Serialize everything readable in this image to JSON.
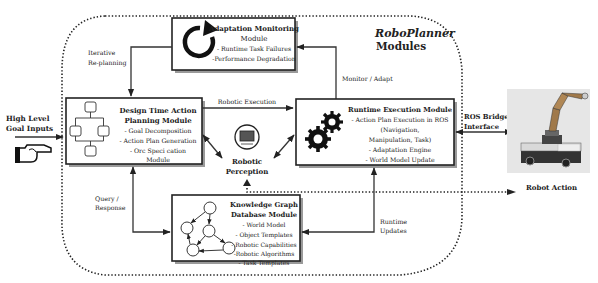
{
  "title": {
    "line1": "RoboPlanner",
    "line2": "Modules"
  },
  "inputs": {
    "goal_line1": "High Level",
    "goal_line2": "Goal Inputs",
    "icon": "pointing-hand-icon"
  },
  "modules": {
    "adaptation": {
      "title_line1": "Adaptation Monitoring",
      "title_line2": "Module",
      "items": [
        "- Runtime Task Failures",
        "-Performance Degradation"
      ],
      "icon": "circular-arrow-icon"
    },
    "design_time": {
      "title_line1": "Design Time Action",
      "title_line2": "Planning Module",
      "items": [
        "- Goal Decomposition",
        "- Action Plan Generation",
        "- Orc Speci cation",
        "Module"
      ],
      "icon": "flowchart-icon"
    },
    "runtime": {
      "title_line1": "Runtime Execution Module",
      "items": [
        "- Action Plan Execution in ROS",
        "(Navigation,",
        "Manipulation, Task)",
        "- Adaptation Engine",
        "- World Model Update"
      ],
      "icon": "gears-icon"
    },
    "knowledge": {
      "title_line1": "Knowledge Graph",
      "title_line2": "Database Module",
      "items": [
        "- World Model",
        "- Object Templates",
        "- Robotic Capabilities",
        "-Robotic Algorithms",
        "- Task Templates"
      ],
      "icon": "graph-icon"
    },
    "perception": {
      "line1": "Robotic",
      "line2": "Perception",
      "icon": "camera-sensor-icon"
    }
  },
  "edges": {
    "iterative_line1": "Iterative",
    "iterative_line2": "Re-planning",
    "robotic_execution": "Robotic Execution",
    "monitor_adapt": "Monitor / Adapt",
    "query_line1": "Query /",
    "query_line2": "Response",
    "runtime_updates_line1": "Runtime",
    "runtime_updates_line2": "Updates",
    "ros_bridge_line1": "ROS Bridge",
    "ros_bridge_line2": "Interface"
  },
  "robot": {
    "label": "Robot Action",
    "image": "mobile-manipulator-robot-photo"
  }
}
